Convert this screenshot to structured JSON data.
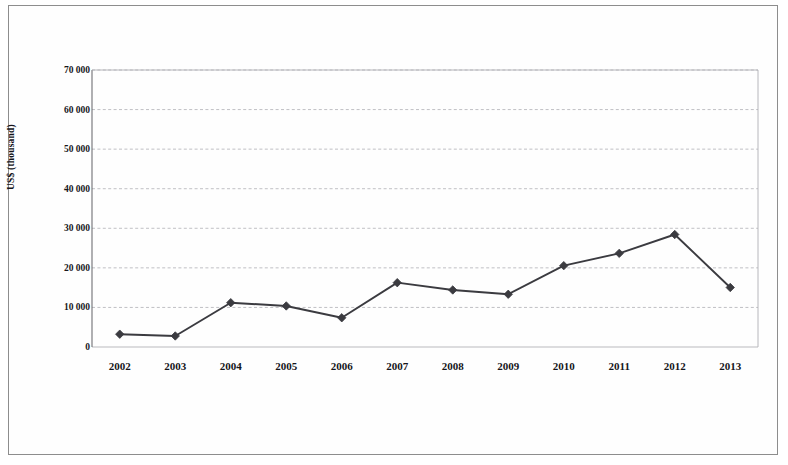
{
  "chart_data": {
    "type": "line",
    "title": "",
    "xlabel": "",
    "ylabel": "US$ (thousand)",
    "ylim": [
      0,
      70000
    ],
    "ytick_values": [
      0,
      10000,
      20000,
      30000,
      40000,
      50000,
      60000,
      70000
    ],
    "ytick_labels": [
      "0",
      "10 000",
      "20 000",
      "30 000",
      "40 000",
      "50 000",
      "60 000",
      "70 000"
    ],
    "grid": true,
    "legend_position": "bottom",
    "categories": [
      "2002",
      "2003",
      "2004",
      "2005",
      "2006",
      "2007",
      "2008",
      "2009",
      "2010",
      "2011",
      "2012",
      "2013"
    ],
    "series": [
      {
        "name": "Bilateral",
        "marker": "diamond",
        "color": "#3b3b40",
        "values": [
          3239,
          2785,
          11195,
          10372,
          7384,
          16255,
          14409,
          13326,
          20554,
          23669,
          28429,
          15041
        ],
        "labels": [
          "3 239",
          "2 785",
          "11 195",
          "10 372",
          "7 384",
          "16 255",
          "14 409",
          "13 326",
          "20 554",
          "23 669",
          "28 429",
          "15 041"
        ]
      },
      {
        "name": "Multilateral",
        "marker": "square",
        "color": "#141418",
        "values": [
          8762,
          13244,
          16276,
          14556,
          17608,
          26062,
          31227,
          35267,
          21456,
          36079,
          22264,
          18489
        ],
        "labels": [
          "8 762",
          "13 244",
          "16 276",
          "14 556",
          "17 608",
          "26 062",
          "31 227",
          "35 267",
          "21 456",
          "36 079",
          "22 264",
          "18 489"
        ]
      },
      {
        "name": "NGO",
        "marker": "triangle",
        "color": "#a8a8ad",
        "values": [
          694,
          271,
          50,
          93,
          179,
          922,
          541,
          552,
          981,
          1852,
          1439,
          910
        ],
        "labels": [
          "694",
          "271",
          "50",
          "93",
          "179",
          "922",
          "541",
          "552",
          "981",
          "1 852",
          "1 439",
          "910"
        ]
      },
      {
        "name": "Total",
        "marker": "cross",
        "color": "#2a2a30",
        "values": [
          12694,
          16299,
          27550,
          25024,
          25508,
          43238,
          45077,
          49150,
          42987,
          61628,
          52199,
          34440
        ],
        "labels": [
          "12 694",
          "16 299",
          "27 550",
          "25 024",
          "25 508",
          "43 238",
          "45 077",
          "49 150",
          "42 987",
          "61 628",
          "52 199",
          "34 440"
        ]
      }
    ]
  },
  "legend": {
    "items": [
      {
        "label": "Bilateral"
      },
      {
        "label": "Multilateral"
      },
      {
        "label": "NGO"
      },
      {
        "label": "Total"
      }
    ]
  }
}
